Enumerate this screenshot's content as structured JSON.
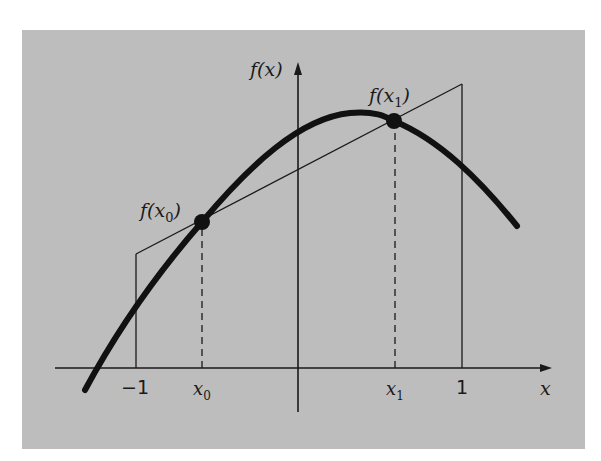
{
  "figure": {
    "background_color": "#bdbdbd",
    "line_color": "#1a1a1a",
    "axes": {
      "x_label": "x",
      "y_label": "f(x)"
    },
    "x_ticks": {
      "minus_one": "−1",
      "x0": "x",
      "x0_sub": "0",
      "x1": "x",
      "x1_sub": "1",
      "one": "1"
    },
    "points": {
      "p0_label_f": "f(",
      "p0_label_x": "x",
      "p0_label_sub": "0",
      "p0_label_close": ")",
      "p1_label_f": "f(",
      "p1_label_x": "x",
      "p1_label_sub": "1",
      "p1_label_close": ")"
    },
    "elements": [
      "curve f(x)",
      "straight line through f(x0) and f(x1)",
      "trapezoid bounded by x = -1 and x = 1",
      "dashed verticals at x0 and x1"
    ]
  }
}
